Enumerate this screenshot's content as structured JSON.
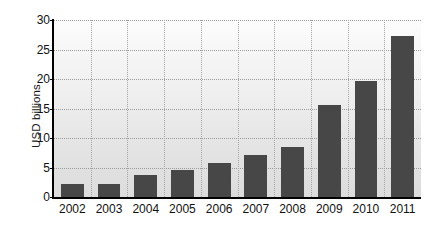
{
  "chart_data": {
    "type": "bar",
    "title": "",
    "xlabel": "",
    "ylabel": "USD billions",
    "categories": [
      "2002",
      "2003",
      "2004",
      "2005",
      "2006",
      "2007",
      "2008",
      "2009",
      "2010",
      "2011"
    ],
    "values": [
      2.2,
      2.2,
      3.8,
      4.6,
      5.7,
      7.2,
      8.5,
      15.6,
      19.6,
      27.3
    ],
    "ylim": [
      0,
      30
    ],
    "yticks": [
      0,
      5,
      10,
      15,
      20,
      25,
      30
    ],
    "ytick_labels": [
      "0",
      "5",
      "10",
      "15",
      "20",
      "25",
      "30"
    ],
    "grid": true,
    "grid_orientation": "both",
    "grid_style": "dotted",
    "legend": false,
    "legend_position": "none",
    "bar_color": "#474747",
    "plot_background": "light-gray-vertical-gradient",
    "axis_color": "#000000",
    "gridline_color": "#9b9b9b"
  }
}
